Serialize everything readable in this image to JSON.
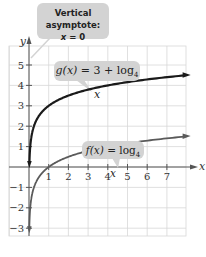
{
  "chart_data": {
    "type": "line",
    "title": "",
    "xlabel": "x",
    "ylabel": "y",
    "xlim": [
      -1,
      8
    ],
    "ylim": [
      -4,
      6
    ],
    "x_ticks": [
      1,
      2,
      3,
      4,
      5,
      6,
      7
    ],
    "y_ticks": [
      -3,
      -2,
      -1,
      1,
      2,
      3,
      4,
      5
    ],
    "grid": true,
    "series": [
      {
        "name": "g(x) = 3 + log4 x",
        "function": "3 + log4(x)",
        "color": "#1a1a1a",
        "x": [
          0.01,
          0.0625,
          0.25,
          1,
          4,
          8
        ],
        "y": [
          -0.32,
          1,
          2,
          3,
          4,
          4.5
        ]
      },
      {
        "name": "f(x) = log4 x",
        "function": "log4(x)",
        "color": "#555555",
        "x": [
          0.01,
          0.0625,
          0.25,
          1,
          4,
          8
        ],
        "y": [
          -3.32,
          -2,
          -1,
          0,
          1,
          1.5
        ]
      }
    ],
    "annotations": [
      {
        "text": "Vertical asymptote: x = 0"
      },
      {
        "text": "g(x) = 3 + log4 x"
      },
      {
        "text": "f(x) = log4 x"
      }
    ]
  },
  "labels": {
    "asymptote_line1": "Vertical asymptote:",
    "asymptote_x": "x",
    "asymptote_eq": " = 0",
    "g_name": "g(x)",
    "g_eq": " = 3 + log",
    "g_base": "4",
    "g_var": " x",
    "f_name": "f(x)",
    "f_eq": " = log",
    "f_base": "4",
    "f_var": " x",
    "x_axis": "x",
    "y_axis": "y"
  },
  "colors": {
    "grid": "#d8d8d8",
    "axis": "#555555",
    "g_curve": "#1a1a1a",
    "f_curve": "#5a5a5a",
    "callout": "#d3d3d3"
  }
}
